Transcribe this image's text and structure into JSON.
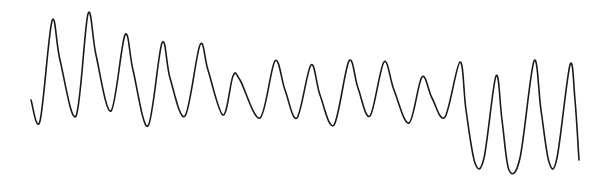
{
  "figure": {
    "background": "#ffffff",
    "trace_color": "#1a1a1a"
  },
  "chart_data": {
    "type": "line",
    "title": "",
    "xlabel": "",
    "ylabel": "",
    "grid": false,
    "legend": null,
    "axes_visible": false,
    "coordinate_space": "pixels (610x187, y grows downward)",
    "series": [
      {
        "name": "waveform",
        "color": "#1a1a1a",
        "points": [
          [
            31,
            100
          ],
          [
            40,
            121
          ],
          [
            52,
            21
          ],
          [
            60,
            60
          ],
          [
            76,
            116
          ],
          [
            88,
            14
          ],
          [
            96,
            55
          ],
          [
            111,
            111
          ],
          [
            125,
            35
          ],
          [
            133,
            70
          ],
          [
            148,
            126
          ],
          [
            162,
            43
          ],
          [
            170,
            78
          ],
          [
            185,
            116
          ],
          [
            200,
            45
          ],
          [
            208,
            70
          ],
          [
            223,
            115
          ],
          [
            233,
            76
          ],
          [
            240,
            80
          ],
          [
            260,
            118
          ],
          [
            275,
            61
          ],
          [
            285,
            90
          ],
          [
            297,
            118
          ],
          [
            311,
            65
          ],
          [
            320,
            95
          ],
          [
            334,
            125
          ],
          [
            349,
            61
          ],
          [
            358,
            88
          ],
          [
            370,
            116
          ],
          [
            384,
            62
          ],
          [
            394,
            90
          ],
          [
            409,
            123
          ],
          [
            422,
            77
          ],
          [
            432,
            98
          ],
          [
            445,
            117
          ],
          [
            460,
            62
          ],
          [
            466,
            110
          ],
          [
            475,
            163
          ],
          [
            484,
            158
          ],
          [
            496,
            76
          ],
          [
            502,
            120
          ],
          [
            509,
            170
          ],
          [
            520,
            158
          ],
          [
            534,
            61
          ],
          [
            541,
            110
          ],
          [
            549,
            162
          ],
          [
            557,
            158
          ],
          [
            570,
            65
          ],
          [
            575,
            100
          ],
          [
            579,
            160
          ]
        ]
      }
    ],
    "peaks": [
      [
        52,
        21
      ],
      [
        88,
        14
      ],
      [
        125,
        35
      ],
      [
        162,
        43
      ],
      [
        200,
        45
      ],
      [
        233,
        76
      ],
      [
        275,
        61
      ],
      [
        311,
        65
      ],
      [
        349,
        61
      ],
      [
        384,
        62
      ],
      [
        422,
        77
      ],
      [
        460,
        62
      ],
      [
        496,
        76
      ],
      [
        534,
        61
      ],
      [
        570,
        65
      ]
    ],
    "troughs": [
      [
        40,
        121
      ],
      [
        76,
        116
      ],
      [
        111,
        111
      ],
      [
        148,
        126
      ],
      [
        185,
        116
      ],
      [
        223,
        115
      ],
      [
        260,
        118
      ],
      [
        297,
        118
      ],
      [
        334,
        125
      ],
      [
        370,
        116
      ],
      [
        409,
        123
      ],
      [
        445,
        117
      ],
      [
        475,
        163
      ],
      [
        509,
        170
      ],
      [
        549,
        162
      ]
    ],
    "xlim": [
      0,
      610
    ],
    "ylim": [
      0,
      187
    ]
  }
}
